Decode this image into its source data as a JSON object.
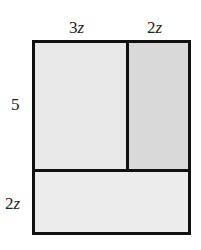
{
  "diagram": {
    "type": "area-model-rectangle",
    "colors": {
      "border": "#111111",
      "top_left_fill": "#e9e9e9",
      "top_right_fill": "#d9d9d9",
      "bottom_fill": "#ececec"
    },
    "labels": {
      "top_left": {
        "coef": "3",
        "var": "z"
      },
      "top_right": {
        "coef": "2",
        "var": "z"
      },
      "left_top": {
        "coef": "5",
        "var": ""
      },
      "left_bottom": {
        "coef": "2",
        "var": "z"
      }
    },
    "regions": [
      {
        "name": "top-left",
        "width": "3z",
        "height": "5"
      },
      {
        "name": "top-right",
        "width": "2z",
        "height": "5"
      },
      {
        "name": "bottom",
        "width": "5z",
        "height": "2z"
      }
    ]
  }
}
